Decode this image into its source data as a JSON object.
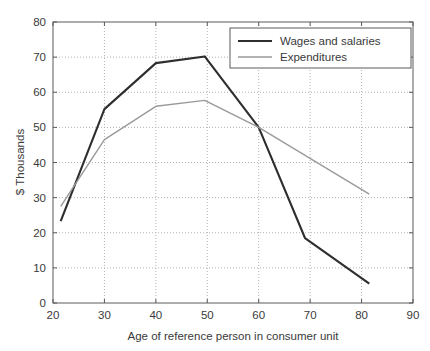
{
  "chart_data": {
    "type": "line",
    "title": "",
    "xlabel": "Age of reference person in consumer unit",
    "ylabel": "$ Thousands",
    "xlim": [
      20,
      90
    ],
    "ylim": [
      0,
      80
    ],
    "xticks": [
      20,
      30,
      40,
      50,
      60,
      70,
      80,
      90
    ],
    "xtick_labels": [
      "20",
      "30",
      "40",
      "50",
      "60",
      "70",
      "80",
      "90"
    ],
    "yticks": [
      0,
      10,
      20,
      30,
      40,
      50,
      60,
      70,
      80
    ],
    "ytick_labels": [
      "0",
      "10",
      "20",
      "30",
      "40",
      "50",
      "60",
      "70",
      "80"
    ],
    "grid": true,
    "grid_style": "dotted",
    "legend_position": "top-right",
    "series": [
      {
        "name": "Wages and salaries",
        "color": "#2e2e2e",
        "line_width": 2.1,
        "x": [
          21.5,
          30,
          40,
          49.5,
          60,
          69,
          81.5
        ],
        "values": [
          23.3,
          55.2,
          68.3,
          70.2,
          50.0,
          18.5,
          5.5
        ]
      },
      {
        "name": "Expenditures",
        "color": "#9a9a9a",
        "line_width": 1.4,
        "x": [
          21.5,
          30,
          40,
          49.5,
          60,
          81.5
        ],
        "values": [
          27.5,
          46.5,
          56.0,
          57.7,
          50.0,
          31.0
        ]
      }
    ]
  },
  "axes": {
    "frame_color": "#5a5a5a",
    "grid_color": "#9f9f9f",
    "background": "#ffffff"
  },
  "legend": {
    "entries": [
      {
        "label": "Wages and salaries"
      },
      {
        "label": "Expenditures"
      }
    ]
  }
}
